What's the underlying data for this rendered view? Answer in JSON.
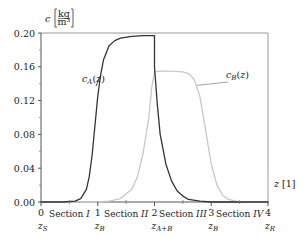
{
  "chart_data": {
    "type": "line",
    "title": "",
    "xlabel": "z [1]",
    "ylabel": "c [kg/m³]",
    "ylabel_symbol": "c",
    "ylabel_unit_num": "kg",
    "ylabel_unit_den": "m³",
    "xlabel_symbol": "z",
    "xlabel_unit": "[1]",
    "xlim": [
      0,
      4
    ],
    "ylim": [
      0.0,
      0.2
    ],
    "grid": false,
    "x_ticks": [
      {
        "value": 0,
        "label": "0",
        "sublabel": "z",
        "subscript": "S"
      },
      {
        "value": 1,
        "label": "1",
        "sublabel": "z",
        "subscript": "B"
      },
      {
        "value": 2,
        "label": "2",
        "sublabel": "z",
        "subscript": "A+B"
      },
      {
        "value": 3,
        "label": "3",
        "sublabel": "z",
        "subscript": "B"
      },
      {
        "value": 4,
        "label": "4",
        "sublabel": "z",
        "subscript": "R"
      }
    ],
    "y_ticks": [
      "0.00",
      "0.04",
      "0.08",
      "0.12",
      "0.16",
      "0.20"
    ],
    "y_tick_values": [
      0.0,
      0.04,
      0.08,
      0.12,
      0.16,
      0.2
    ],
    "sections": [
      {
        "label": "Section",
        "numeral": "I",
        "center": 0.5
      },
      {
        "label": "Section",
        "numeral": "II",
        "center": 1.5
      },
      {
        "label": "Section",
        "numeral": "III",
        "center": 2.5
      },
      {
        "label": "Section",
        "numeral": "IV",
        "center": 3.5
      }
    ],
    "series": [
      {
        "name": "c_A(z)",
        "label_main": "c",
        "label_sub": "A",
        "label_arg": "(z)",
        "color": "#333333",
        "x": [
          0.0,
          0.4,
          0.6,
          0.7,
          0.8,
          0.85,
          0.9,
          0.95,
          1.0,
          1.05,
          1.1,
          1.2,
          1.3,
          1.4,
          1.6,
          1.8,
          2.0,
          2.0,
          2.05,
          2.1,
          2.2,
          2.3,
          2.4,
          2.5,
          2.6,
          2.8,
          3.0,
          3.5,
          4.0
        ],
        "values": [
          0.0,
          0.0,
          0.001,
          0.004,
          0.015,
          0.03,
          0.055,
          0.09,
          0.125,
          0.15,
          0.168,
          0.185,
          0.191,
          0.194,
          0.196,
          0.197,
          0.197,
          0.16,
          0.115,
          0.08,
          0.045,
          0.025,
          0.013,
          0.007,
          0.003,
          0.001,
          0.0,
          0.0,
          0.0
        ]
      },
      {
        "name": "c_B(z)",
        "label_main": "c",
        "label_sub": "B",
        "label_arg": "(z)",
        "color": "#c8c8c8",
        "x": [
          0.0,
          1.0,
          1.2,
          1.4,
          1.6,
          1.7,
          1.8,
          1.9,
          1.95,
          2.0,
          2.1,
          2.3,
          2.5,
          2.6,
          2.7,
          2.8,
          2.9,
          3.0,
          3.1,
          3.2,
          3.3,
          3.5,
          4.0
        ],
        "values": [
          0.0,
          0.0,
          0.001,
          0.004,
          0.015,
          0.03,
          0.058,
          0.1,
          0.135,
          0.154,
          0.155,
          0.155,
          0.154,
          0.152,
          0.145,
          0.125,
          0.085,
          0.045,
          0.02,
          0.008,
          0.003,
          0.0,
          0.0
        ]
      }
    ],
    "annotations": [
      {
        "text": "c_A(z)",
        "x_px": 82,
        "y_px": 82,
        "arrow_to": [
          1.05,
          0.15
        ]
      },
      {
        "text": "c_B(z)",
        "x_px": 226,
        "y_px": 78,
        "arrow_to": [
          2.75,
          0.138
        ]
      }
    ]
  }
}
